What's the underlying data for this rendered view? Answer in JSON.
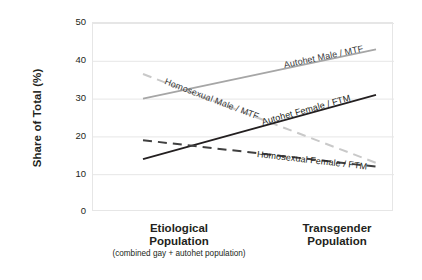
{
  "chart_data": {
    "type": "line",
    "title": "",
    "xlabel": "",
    "ylabel": "Share of Total (%)",
    "ylim": [
      0,
      50
    ],
    "yticks": [
      50,
      40,
      30,
      20,
      10,
      0
    ],
    "grid": true,
    "legend_position": "inline-on-line",
    "categories": [
      "Etiological Population",
      "Transgender Population"
    ],
    "category_sublabels": [
      "(combined gay + autohet population)",
      ""
    ],
    "series": [
      {
        "name": "Autohet Male / MTF",
        "values": [
          30,
          43
        ],
        "style": "solid",
        "color": "#a6a6a6",
        "label_angle_deg": -11
      },
      {
        "name": "Homosexual Male / MTF",
        "values": [
          36.5,
          13
        ],
        "style": "dashed",
        "color": "#c9c9c9",
        "label_angle_deg": 25
      },
      {
        "name": "Autohet Female / FTM",
        "values": [
          14,
          31
        ],
        "style": "solid",
        "color": "#231f20",
        "label_angle_deg": -12
      },
      {
        "name": "Homosexual Female / FTM",
        "values": [
          19,
          12
        ],
        "style": "dashed",
        "color": "#404040",
        "label_angle_deg": 4
      }
    ]
  },
  "axis": {
    "y_title": "Share of Total (%)",
    "y_tick_labels": [
      "50",
      "40",
      "30",
      "20",
      "10",
      "0"
    ]
  },
  "x_axis": {
    "left": {
      "line1": "Etiological",
      "line2": "Population",
      "sub": "(combined gay + autohet population)"
    },
    "right": {
      "line1": "Transgender",
      "line2": "Population",
      "sub": ""
    }
  },
  "series_labels": {
    "autohet_male": "Autohet Male / MTF",
    "homosexual_male": "Homosexual Male / MTF",
    "autohet_female": "Autohet Female / FTM",
    "homosexual_female": "Homosexual Female / FTM"
  },
  "colors": {
    "axis_text": "#231f20",
    "grid": "#e6e6e6",
    "autohet_male": "#a6a6a6",
    "homosexual_male": "#c9c9c9",
    "autohet_female": "#231f20",
    "homosexual_female": "#404040"
  }
}
